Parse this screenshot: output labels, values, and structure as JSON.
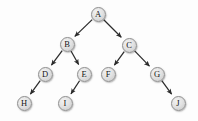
{
  "figure": {
    "name": "binary-tree-diagram",
    "background_color": "#fdfdfd",
    "width": 198,
    "height": 121
  },
  "style": {
    "node_fill": "#e2e2e2",
    "node_stroke": "#8e8e8e",
    "node_label_color": "#151515",
    "edge_color": "#2b2b2b",
    "node_radius": 7.5
  },
  "chart_data": {
    "type": "diagram",
    "subtype": "rooted-binary-tree",
    "title": "",
    "root": "A",
    "directed": true,
    "nodes": [
      {
        "id": "A",
        "label": "A",
        "x": 98,
        "y": 14,
        "depth": 0
      },
      {
        "id": "B",
        "label": "B",
        "x": 67,
        "y": 44,
        "depth": 1
      },
      {
        "id": "C",
        "label": "C",
        "x": 129,
        "y": 45,
        "depth": 1
      },
      {
        "id": "D",
        "label": "D",
        "x": 45,
        "y": 74,
        "depth": 2
      },
      {
        "id": "E",
        "label": "E",
        "x": 84,
        "y": 74,
        "depth": 2
      },
      {
        "id": "F",
        "label": "F",
        "x": 108,
        "y": 74,
        "depth": 2
      },
      {
        "id": "G",
        "label": "G",
        "x": 157,
        "y": 74,
        "depth": 2
      },
      {
        "id": "H",
        "label": "H",
        "x": 24,
        "y": 103,
        "depth": 3
      },
      {
        "id": "I",
        "label": "I",
        "x": 65,
        "y": 103,
        "depth": 3
      },
      {
        "id": "J",
        "label": "J",
        "x": 178,
        "y": 103,
        "depth": 3
      }
    ],
    "edges": [
      {
        "from": "A",
        "to": "B",
        "side": "left"
      },
      {
        "from": "A",
        "to": "C",
        "side": "right"
      },
      {
        "from": "B",
        "to": "D",
        "side": "left"
      },
      {
        "from": "B",
        "to": "E",
        "side": "right"
      },
      {
        "from": "C",
        "to": "F",
        "side": "left"
      },
      {
        "from": "C",
        "to": "G",
        "side": "right"
      },
      {
        "from": "D",
        "to": "H",
        "side": "left"
      },
      {
        "from": "E",
        "to": "I",
        "side": "left"
      },
      {
        "from": "G",
        "to": "J",
        "side": "right"
      }
    ]
  }
}
